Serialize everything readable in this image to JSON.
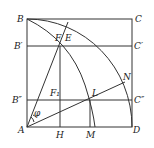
{
  "diagram": {
    "points": {
      "A": {
        "label": "A",
        "x": 27,
        "y": 127
      },
      "B": {
        "label": "B",
        "x": 27,
        "y": 19
      },
      "C": {
        "label": "C",
        "x": 132,
        "y": 19
      },
      "D": {
        "label": "D",
        "x": 132,
        "y": 127
      },
      "B1": {
        "label": "B′",
        "x": 27,
        "y": 46
      },
      "C1": {
        "label": "C′",
        "x": 132,
        "y": 46
      },
      "B2": {
        "label": "B″",
        "x": 27,
        "y": 100
      },
      "C2": {
        "label": "C″",
        "x": 132,
        "y": 100
      },
      "F": {
        "label": "F",
        "x": 60,
        "y": 46
      },
      "E": {
        "label": "E",
        "x": 67,
        "y": 24
      },
      "F1": {
        "label": "F₁",
        "x": 60,
        "y": 100
      },
      "L": {
        "label": "L",
        "x": 90,
        "y": 100
      },
      "N": {
        "label": "N",
        "x": 125,
        "y": 81
      },
      "H": {
        "label": "H",
        "x": 60,
        "y": 127
      },
      "M": {
        "label": "M",
        "x": 90,
        "y": 127
      }
    },
    "angle_label": "φ",
    "stroke_color": "#333333"
  }
}
